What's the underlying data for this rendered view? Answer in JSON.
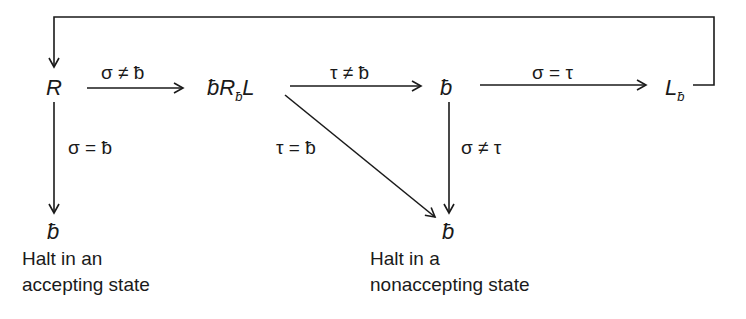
{
  "diagram": {
    "type": "flow-diagram",
    "nodes": {
      "start": {
        "text": "R"
      },
      "blank_right_left": {
        "prefix": "ƀR",
        "sub": "ƀ",
        "suffix": "L"
      },
      "compare": {
        "text": "ƀ"
      },
      "left_blank": {
        "text": "L",
        "sub": "ƀ"
      },
      "halt_accept": {
        "text": "ƀ",
        "caption_line1": "Halt in an",
        "caption_line2": "accepting state"
      },
      "halt_reject": {
        "text": "ƀ",
        "caption_line1": "Halt in a",
        "caption_line2": "nonaccepting state"
      }
    },
    "edges": [
      {
        "from": "start",
        "to": "blank_right_left",
        "label": "σ ≠ ƀ"
      },
      {
        "from": "blank_right_left",
        "to": "compare",
        "label": "τ ≠ ƀ"
      },
      {
        "from": "compare",
        "to": "left_blank",
        "label": "σ = τ"
      },
      {
        "from": "start",
        "to": "halt_accept",
        "label": "σ = ƀ"
      },
      {
        "from": "blank_right_left",
        "to": "halt_reject",
        "label": "τ = ƀ"
      },
      {
        "from": "compare",
        "to": "halt_reject",
        "label": "σ ≠ τ"
      },
      {
        "from": "left_blank",
        "to": "start",
        "label": ""
      }
    ],
    "stroke_color": "#1a1a1a"
  }
}
